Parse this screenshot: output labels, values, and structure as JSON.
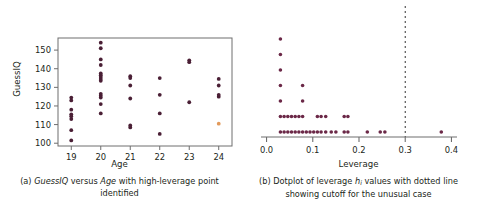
{
  "figure": {
    "panel_a": {
      "caption_prefix": "(a) ",
      "caption_part1": "GuessIQ",
      "caption_mid": " versus ",
      "caption_part2": "Age",
      "caption_suffix": " with high-leverage point identified",
      "xlabel": "Age",
      "ylabel": "GuessIQ",
      "xticks": [
        "19",
        "20",
        "21",
        "22",
        "23",
        "24"
      ],
      "yticks": [
        "100",
        "110",
        "120",
        "130",
        "140",
        "150"
      ],
      "point_color": "#4a1f35",
      "highlight_color": "#e29a5b",
      "frame_color": "#6e6e6e"
    },
    "panel_b": {
      "caption_prefix": "(b) Dotplot of leverage ",
      "caption_symbol": "h",
      "caption_subscript": "i",
      "caption_suffix": " values with dotted line showing cutoff for the unusual case",
      "xlabel": "Leverage",
      "xticks": [
        "0.0",
        "0.1",
        "0.2",
        "0.3",
        "0.4"
      ],
      "cutoff_label": "0.3",
      "point_color": "#6b2847",
      "axis_color": "#6e6e6e",
      "cutoff_line_color": "#333333"
    }
  },
  "chart_data": [
    {
      "type": "scatter",
      "panel": "a",
      "title": "GuessIQ versus Age with high-leverage point identified",
      "xlabel": "Age",
      "ylabel": "GuessIQ",
      "xlim": [
        18.55,
        24.45
      ],
      "ylim": [
        98.5,
        156.5
      ],
      "xticks": [
        19,
        20,
        21,
        22,
        23,
        24
      ],
      "yticks": [
        100,
        110,
        120,
        130,
        140,
        150
      ],
      "grid": false,
      "legend": "none",
      "points": [
        {
          "x": 19,
          "y": 101.5,
          "series": "normal"
        },
        {
          "x": 19,
          "y": 107,
          "series": "normal"
        },
        {
          "x": 19,
          "y": 113,
          "series": "normal"
        },
        {
          "x": 19,
          "y": 114.5,
          "series": "normal"
        },
        {
          "x": 19,
          "y": 115.5,
          "series": "normal"
        },
        {
          "x": 19,
          "y": 118,
          "series": "normal"
        },
        {
          "x": 19,
          "y": 123,
          "series": "normal"
        },
        {
          "x": 19,
          "y": 124.5,
          "series": "normal"
        },
        {
          "x": 20,
          "y": 116,
          "series": "normal"
        },
        {
          "x": 20,
          "y": 121,
          "series": "normal"
        },
        {
          "x": 20,
          "y": 124.5,
          "series": "normal"
        },
        {
          "x": 20,
          "y": 125.5,
          "series": "normal"
        },
        {
          "x": 20,
          "y": 126.5,
          "series": "normal"
        },
        {
          "x": 20,
          "y": 133.5,
          "series": "normal"
        },
        {
          "x": 20,
          "y": 134.5,
          "series": "normal"
        },
        {
          "x": 20,
          "y": 135.5,
          "series": "normal"
        },
        {
          "x": 20,
          "y": 136.5,
          "series": "normal"
        },
        {
          "x": 20,
          "y": 137.5,
          "series": "normal"
        },
        {
          "x": 20,
          "y": 142,
          "series": "normal"
        },
        {
          "x": 20,
          "y": 145,
          "series": "normal"
        },
        {
          "x": 20,
          "y": 151,
          "series": "normal"
        },
        {
          "x": 20,
          "y": 154,
          "series": "normal"
        },
        {
          "x": 21,
          "y": 108.5,
          "series": "normal"
        },
        {
          "x": 21,
          "y": 109.5,
          "series": "normal"
        },
        {
          "x": 21,
          "y": 124,
          "series": "normal"
        },
        {
          "x": 21,
          "y": 131,
          "series": "normal"
        },
        {
          "x": 21,
          "y": 135,
          "series": "normal"
        },
        {
          "x": 21,
          "y": 136,
          "series": "normal"
        },
        {
          "x": 22,
          "y": 105,
          "series": "normal"
        },
        {
          "x": 22,
          "y": 116,
          "series": "normal"
        },
        {
          "x": 22,
          "y": 126,
          "series": "normal"
        },
        {
          "x": 22,
          "y": 135,
          "series": "normal"
        },
        {
          "x": 23,
          "y": 122,
          "series": "normal"
        },
        {
          "x": 23,
          "y": 143.5,
          "series": "normal"
        },
        {
          "x": 23,
          "y": 144.5,
          "series": "normal"
        },
        {
          "x": 24,
          "y": 110.5,
          "series": "high-leverage"
        },
        {
          "x": 24,
          "y": 125,
          "series": "normal"
        },
        {
          "x": 24,
          "y": 126,
          "series": "normal"
        },
        {
          "x": 24,
          "y": 131,
          "series": "normal"
        },
        {
          "x": 24,
          "y": 134.5,
          "series": "normal"
        }
      ]
    },
    {
      "type": "dotplot",
      "panel": "b",
      "title": "Dotplot of leverage h_i values with dotted line showing cutoff for the unusual case",
      "xlabel": "Leverage",
      "ylabel": "",
      "xlim": [
        -0.012,
        0.412
      ],
      "xticks": [
        0.0,
        0.1,
        0.2,
        0.3,
        0.4
      ],
      "grid": false,
      "legend": "none",
      "cutoff": 0.3,
      "stacks": [
        {
          "x": 0.03,
          "count": 7
        },
        {
          "x": 0.038,
          "count": 2
        },
        {
          "x": 0.046,
          "count": 2
        },
        {
          "x": 0.054,
          "count": 2
        },
        {
          "x": 0.062,
          "count": 2
        },
        {
          "x": 0.07,
          "count": 2
        },
        {
          "x": 0.078,
          "count": 4
        },
        {
          "x": 0.086,
          "count": 1
        },
        {
          "x": 0.094,
          "count": 1
        },
        {
          "x": 0.102,
          "count": 1
        },
        {
          "x": 0.11,
          "count": 2
        },
        {
          "x": 0.118,
          "count": 2
        },
        {
          "x": 0.128,
          "count": 2
        },
        {
          "x": 0.14,
          "count": 1
        },
        {
          "x": 0.15,
          "count": 1
        },
        {
          "x": 0.168,
          "count": 2
        },
        {
          "x": 0.176,
          "count": 2
        },
        {
          "x": 0.218,
          "count": 1
        },
        {
          "x": 0.246,
          "count": 1
        },
        {
          "x": 0.256,
          "count": 1
        },
        {
          "x": 0.378,
          "count": 1
        }
      ]
    }
  ]
}
